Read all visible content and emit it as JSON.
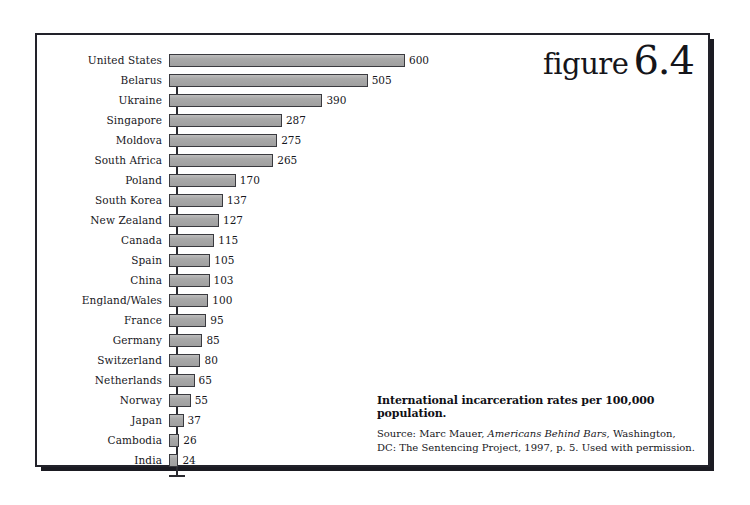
{
  "figure": {
    "word": "figure",
    "number": "6.4"
  },
  "caption": {
    "title": "International incarceration rates per 100,000 population.",
    "source_prefix": "Source: Marc Mauer, ",
    "source_italic": "Americans Behind Bars",
    "source_suffix": ", Washington, DC: The Sentencing Project, 1997, p. 5. Used with permission."
  },
  "chart_data": {
    "type": "bar",
    "orientation": "horizontal",
    "title": "International incarceration rates per 100,000 population.",
    "xlabel": "",
    "ylabel": "",
    "xlim": [
      0,
      600
    ],
    "grid": false,
    "legend": null,
    "bar_color": "#aaaaaa",
    "bar_border_color": "#3a3a3f",
    "categories": [
      "United States",
      "Belarus",
      "Ukraine",
      "Singapore",
      "Moldova",
      "South Africa",
      "Poland",
      "South Korea",
      "New Zealand",
      "Canada",
      "Spain",
      "China",
      "England/Wales",
      "France",
      "Germany",
      "Switzerland",
      "Netherlands",
      "Norway",
      "Japan",
      "Cambodia",
      "India"
    ],
    "values": [
      600,
      505,
      390,
      287,
      275,
      265,
      170,
      137,
      127,
      115,
      105,
      103,
      100,
      95,
      85,
      80,
      65,
      55,
      37,
      26,
      24
    ]
  }
}
